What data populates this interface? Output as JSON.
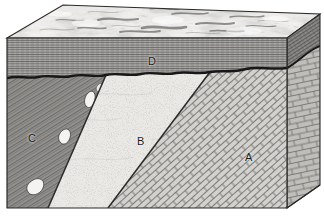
{
  "figure": {
    "kind": "geologic-block-diagram",
    "title": "",
    "caption": "",
    "width": 324,
    "height": 218,
    "background_color": "#ffffff"
  },
  "labels": [
    {
      "id": "A",
      "text": "A",
      "x": 249,
      "y": 158,
      "unit": "tilted-limestone-brick-pattern"
    },
    {
      "id": "B",
      "text": "B",
      "x": 141,
      "y": 142,
      "unit": "stippled-sandstone"
    },
    {
      "id": "C",
      "text": "C",
      "x": 32,
      "y": 139,
      "unit": "hatched-intrusive-with-inclusions"
    },
    {
      "id": "D",
      "text": "D",
      "x": 152,
      "y": 62,
      "unit": "horizontally-bedded-shale"
    }
  ],
  "units": {
    "A": {
      "label": "A",
      "pattern": "tilted-brick",
      "fill": "#d6d4d1",
      "line": "#6b6a68"
    },
    "B": {
      "label": "B",
      "pattern": "stipple",
      "fill": "#e8e7e4",
      "line": "#9a9896"
    },
    "C": {
      "label": "C",
      "pattern": "diagonal-hatch",
      "fill": "#999795",
      "line": "#4a4947"
    },
    "D": {
      "label": "D",
      "pattern": "horizontal-bedding",
      "fill": "#b5b3b0",
      "line": "#5a5957"
    },
    "top_surface": {
      "label": "",
      "pattern": "mottled-topography",
      "fill": "#efeeec",
      "line": "#8d8b88"
    }
  },
  "structures": {
    "unconformity": {
      "name": "unconformity",
      "style": "wavy-heavy-line",
      "color": "#171717"
    },
    "contact_C_B": {
      "name": "contact-C-B",
      "style": "line",
      "color": "#2b2a29"
    },
    "contact_B_A": {
      "name": "contact-B-A",
      "style": "line",
      "color": "#2b2a29"
    },
    "block_outline": {
      "name": "block-outline",
      "color": "#2b2a29"
    }
  },
  "colors": {
    "outline": "#2b2a29",
    "unconformity": "#171717",
    "label_text": "#1c1c1c",
    "page_background": "#ffffff"
  }
}
